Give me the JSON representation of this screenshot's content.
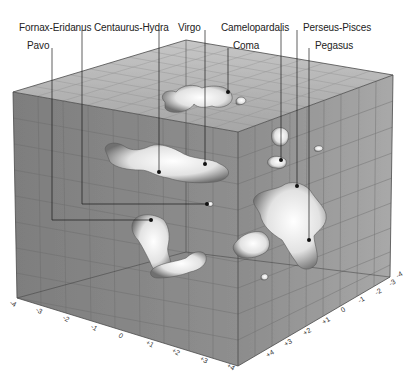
{
  "figure": {
    "colors": {
      "face_left": "#8a8a8a",
      "face_right": "#9d9d9d",
      "face_top": "#b4b4b4",
      "grid": "#6f6f6f",
      "leader": "#1a1a1a",
      "blob_light": "#f4f4f4",
      "blob_dark": "#6a6a6a"
    }
  },
  "labels": [
    {
      "id": "fornax-eridanus",
      "text": "Fornax-Eridanus",
      "x": 19,
      "y": 22
    },
    {
      "id": "pavo",
      "text": "Pavo",
      "x": 27,
      "y": 40
    },
    {
      "id": "centaurus-hydra",
      "text": "Centaurus-Hydra",
      "x": 94,
      "y": 22
    },
    {
      "id": "virgo",
      "text": "Virgo",
      "x": 178,
      "y": 22
    },
    {
      "id": "camelopardalis",
      "text": "Camelopardalis",
      "x": 221,
      "y": 22
    },
    {
      "id": "coma",
      "text": "Coma",
      "x": 233,
      "y": 40
    },
    {
      "id": "perseus-pisces",
      "text": "Perseus-Pisces",
      "x": 303,
      "y": 22
    },
    {
      "id": "pegasus",
      "text": "Pegasus",
      "x": 315,
      "y": 40
    }
  ],
  "axes": {
    "left_axis_ticks": [
      "-4",
      "-3",
      "-2",
      "-1",
      "0",
      "+1",
      "+2",
      "+3",
      "+4"
    ],
    "right_axis_ticks": [
      "+4",
      "+3",
      "+2",
      "+1",
      "0",
      "-1",
      "-2",
      "-3",
      "-4"
    ]
  }
}
